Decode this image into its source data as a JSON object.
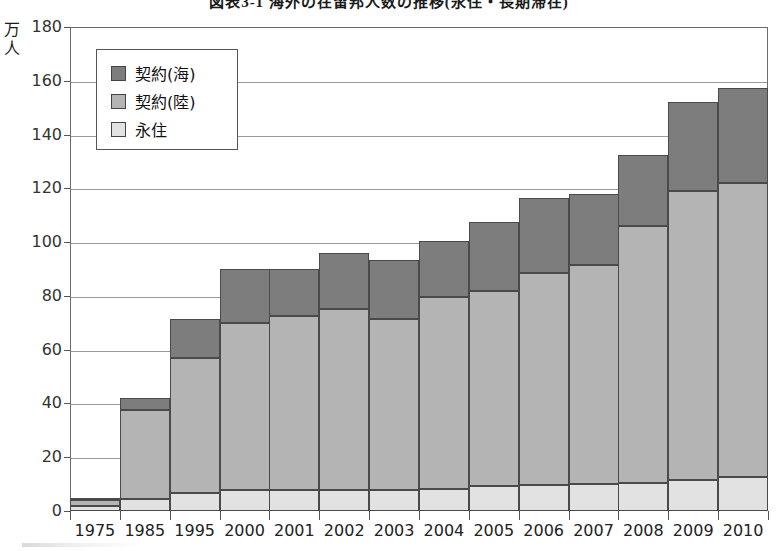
{
  "chart_data": {
    "type": "bar",
    "stacked": true,
    "title": "図表3-1 海外の在留邦人数の推移(永住・長期滞在)",
    "unit_label": "万人",
    "xlabel": "",
    "ylabel": "万人",
    "ylim": [
      0,
      180
    ],
    "ytick_step": 20,
    "yticks": [
      "0",
      "20",
      "40",
      "60",
      "80",
      "100",
      "120",
      "140",
      "160",
      "180"
    ],
    "grid": true,
    "legend_position": "upper-left-inside",
    "categories": [
      "1975",
      "1985",
      "1995",
      "2000",
      "2001",
      "2002",
      "2003",
      "2004",
      "2005",
      "2006",
      "2007",
      "2008",
      "2009",
      "2010"
    ],
    "series": [
      {
        "name": "永住",
        "color": "#e2e2e2",
        "values": [
          2.0,
          4.5,
          6.7,
          7.8,
          7.8,
          7.8,
          7.8,
          8.2,
          9.3,
          9.7,
          10.0,
          10.5,
          11.5,
          12.5
        ]
      },
      {
        "name": "契約(陸)",
        "color": "#b4b4b4",
        "values": [
          2.0,
          33.0,
          50.3,
          62.2,
          64.7,
          67.2,
          63.7,
          71.3,
          72.7,
          78.8,
          81.5,
          95.5,
          107.5,
          109.5
        ]
      },
      {
        "name": "契約(海)",
        "color": "#7d7d7d",
        "values": [
          1.0,
          4.5,
          14.5,
          20.0,
          17.5,
          21.0,
          22.0,
          21.0,
          25.5,
          28.0,
          26.5,
          26.5,
          33.0,
          35.5
        ]
      }
    ],
    "totals": [
      5.0,
      42.0,
      71.5,
      90.0,
      90.0,
      96.0,
      93.5,
      100.5,
      107.5,
      116.5,
      118.0,
      132.5,
      152.0,
      157.5
    ]
  },
  "legend": {
    "items": [
      {
        "label": "契約(海)",
        "color": "#7d7d7d"
      },
      {
        "label": "契約(陸)",
        "color": "#b4b4b4"
      },
      {
        "label": "永住",
        "color": "#e2e2e2"
      }
    ]
  }
}
